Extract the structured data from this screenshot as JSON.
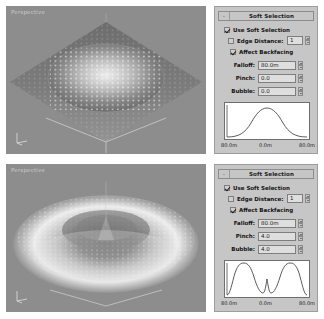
{
  "panels": [
    {
      "viewport": {
        "label": "Perspective",
        "tripod_axes": [
          "x",
          "y",
          "z"
        ]
      },
      "rollout": {
        "minimize_glyph": "-",
        "title": "Soft Selection"
      },
      "checkboxes": [
        {
          "name": "use-soft-selection",
          "label": "Use Soft Selection",
          "checked": true
        },
        {
          "name": "edge-distance",
          "label": "Edge Distance:",
          "checked": false
        },
        {
          "name": "affect-backfacing",
          "label": "Affect Backfacing",
          "checked": true
        }
      ],
      "edge_distance_value": "1",
      "fields": [
        {
          "name": "falloff",
          "label": "Falloff:",
          "value": "80.0m"
        },
        {
          "name": "pinch",
          "label": "Pinch:",
          "value": "0.0"
        },
        {
          "name": "bubble",
          "label": "Bubble:",
          "value": "0.0"
        }
      ],
      "graph": {
        "left_label": "80.0m",
        "center_label": "0.0m",
        "right_label": "80.0m",
        "curve": "bell"
      }
    },
    {
      "viewport": {
        "label": "Perspective",
        "tripod_axes": [
          "x",
          "y",
          "z"
        ]
      },
      "rollout": {
        "minimize_glyph": "-",
        "title": "Soft Selection"
      },
      "checkboxes": [
        {
          "name": "use-soft-selection",
          "label": "Use Soft Selection",
          "checked": true
        },
        {
          "name": "edge-distance",
          "label": "Edge Distance:",
          "checked": false
        },
        {
          "name": "affect-backfacing",
          "label": "Affect Backfacing",
          "checked": true
        }
      ],
      "edge_distance_value": "1",
      "fields": [
        {
          "name": "falloff",
          "label": "Falloff:",
          "value": "80.0m"
        },
        {
          "name": "pinch",
          "label": "Pinch:",
          "value": "4.0"
        },
        {
          "name": "bubble",
          "label": "Bubble:",
          "value": "4.0"
        }
      ],
      "graph": {
        "left_label": "80.0m",
        "center_label": "0.0m",
        "right_label": "80.0m",
        "curve": "oscillating"
      }
    }
  ],
  "colors": {
    "panel_face": "#c6c6c6",
    "field_face": "#dedede",
    "graph_face": "#ffffff",
    "viewport_bg": "#8d8d8d",
    "curve_stroke": "#4a4a4a",
    "text": "#141414"
  }
}
